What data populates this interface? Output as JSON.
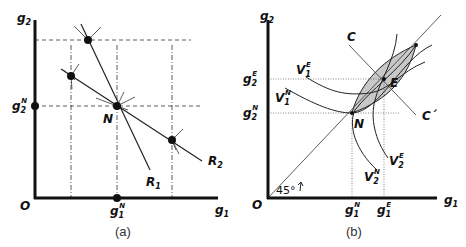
{
  "panel_a": {
    "caption": "(a)",
    "axes": {
      "x_label": "g",
      "x_sub": "1",
      "y_label": "g",
      "y_sub": "2",
      "origin": "O"
    },
    "tick_labels": {
      "g1N": {
        "base": "g",
        "sub": "1",
        "sup": "N"
      },
      "g2N": {
        "base": "g",
        "sub": "2",
        "sup": "N"
      }
    },
    "point_labels": {
      "N": "N"
    },
    "curves": [
      {
        "name": "R",
        "sub": "1"
      },
      {
        "name": "R",
        "sub": "2"
      }
    ]
  },
  "panel_b": {
    "caption": "(b)",
    "axes": {
      "x_label": "g",
      "x_sub": "1",
      "y_label": "g",
      "y_sub": "2",
      "origin": "O"
    },
    "tick_labels": {
      "g1N": {
        "base": "g",
        "sub": "1",
        "sup": "N"
      },
      "g1E": {
        "base": "g",
        "sub": "1",
        "sup": "E"
      },
      "g2N": {
        "base": "g",
        "sub": "2",
        "sup": "N"
      },
      "g2E": {
        "base": "g",
        "sub": "2",
        "sup": "E"
      }
    },
    "point_labels": {
      "N": "N",
      "E": "E"
    },
    "line_labels": {
      "C": "C",
      "C_prime": "C´"
    },
    "curves": [
      {
        "name": "V",
        "sub": "1",
        "sup": "E"
      },
      {
        "name": "V",
        "sub": "1",
        "sup": "N"
      },
      {
        "name": "V",
        "sub": "2",
        "sup": "E"
      },
      {
        "name": "V",
        "sub": "2",
        "sup": "N"
      }
    ],
    "angle_label": "45°",
    "lens_fill": "#c8c8c8"
  }
}
